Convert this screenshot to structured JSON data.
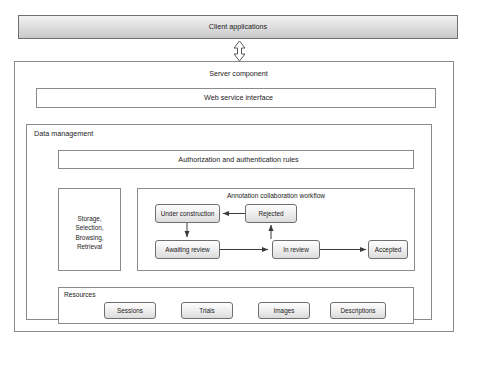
{
  "diagram": {
    "client_bar": {
      "label": "Client applications"
    },
    "connector": {
      "name": "double-headed-vertical-arrow"
    },
    "server": {
      "label": "Server component"
    },
    "web_service": {
      "label": "Web service interface"
    },
    "data_management": {
      "label": "Data management"
    },
    "authorization": {
      "label": "Authorization and authentication rules"
    },
    "storage": {
      "label": "Storage, Selection, Browsing, Retrieval",
      "lines": [
        "Storage,",
        "Selection,",
        "Browsing,",
        "Retrieval"
      ]
    },
    "workflow": {
      "title": "Annotation collaboration workflow",
      "nodes": [
        {
          "id": "under-construction",
          "label": "Under construction"
        },
        {
          "id": "rejected",
          "label": "Rejected"
        },
        {
          "id": "awaiting-review",
          "label": "Awaiting review"
        },
        {
          "id": "in-review",
          "label": "In review"
        },
        {
          "id": "accepted",
          "label": "Accepted"
        }
      ],
      "transitions": [
        {
          "from": "under-construction",
          "to": "awaiting-review",
          "direction": "down"
        },
        {
          "from": "awaiting-review",
          "to": "in-review",
          "direction": "right"
        },
        {
          "from": "in-review",
          "to": "rejected",
          "direction": "up"
        },
        {
          "from": "rejected",
          "to": "under-construction",
          "direction": "left"
        },
        {
          "from": "in-review",
          "to": "accepted",
          "direction": "right"
        }
      ]
    },
    "resources": {
      "label": "Resources",
      "items": [
        {
          "id": "sessions",
          "label": "Sessions"
        },
        {
          "id": "trials",
          "label": "Trials"
        },
        {
          "id": "images",
          "label": "Images"
        },
        {
          "id": "descriptions",
          "label": "Descriptions"
        }
      ]
    },
    "colors": {
      "border": "#8a8a8a",
      "node_border": "#6f6f6f",
      "text": "#1b1b1b",
      "client_bar_fill": "#c9c9c9",
      "node_fill": "#f0f0f0",
      "background": "#ffffff"
    }
  }
}
